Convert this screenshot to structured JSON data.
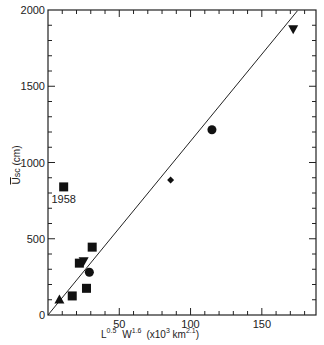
{
  "chart_data": {
    "type": "scatter",
    "title": "",
    "xlabel": "L^0.5 W^1.6 (x10^3 km^2.1)",
    "xlabel_parts": {
      "l": "L",
      "l_exp": "0.5",
      "w": "W",
      "w_exp": "1.6",
      "unit": "(x10",
      "unit_exp": "3",
      "unit2": " km",
      "unit2_exp": "2.1",
      "close": ")"
    },
    "ylabel": "Usc (cm)",
    "ylabel_parts": {
      "main": "U",
      "sub": "sc",
      "unit": " (cm)"
    },
    "xlim": [
      0,
      188
    ],
    "ylim": [
      0,
      2000
    ],
    "x_ticks": [
      50,
      100,
      150
    ],
    "x_tick_labels": [
      "50",
      "100",
      "150"
    ],
    "y_ticks": [
      0,
      500,
      1000,
      1500,
      2000
    ],
    "y_tick_labels": [
      "0",
      "500",
      "1000",
      "1500",
      "2000"
    ],
    "grid": false,
    "legend": "none",
    "series": [
      {
        "name": "triangle-up",
        "marker": "triangle-up",
        "points": [
          [
            8,
            105
          ]
        ]
      },
      {
        "name": "square",
        "marker": "square",
        "points": [
          [
            17,
            125
          ],
          [
            22,
            340
          ],
          [
            27,
            175
          ],
          [
            31,
            445
          ],
          [
            11,
            840
          ]
        ]
      },
      {
        "name": "triangle-down",
        "marker": "triangle-down",
        "points": [
          [
            25,
            350
          ],
          [
            172,
            1870
          ]
        ]
      },
      {
        "name": "circle",
        "marker": "circle",
        "points": [
          [
            29,
            280
          ],
          [
            115,
            1215
          ]
        ]
      },
      {
        "name": "diamond",
        "marker": "diamond",
        "points": [
          [
            86,
            885
          ]
        ]
      }
    ],
    "fit_line": {
      "x": [
        0,
        175
      ],
      "y": [
        0,
        1995
      ]
    },
    "annotations": [
      {
        "text": "1958",
        "x": 11,
        "y": 840
      }
    ]
  }
}
